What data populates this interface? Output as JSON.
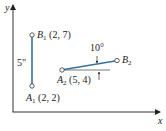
{
  "diagram": {
    "axes": {
      "x_label": "x",
      "y_label": "y"
    },
    "points": [
      {
        "name": "A",
        "sub": "1",
        "coords": "(2, 2)"
      },
      {
        "name": "B",
        "sub": "1",
        "coords": "(2, 7)"
      },
      {
        "name": "A",
        "sub": "2",
        "coords": "(5, 4)"
      },
      {
        "name": "B",
        "sub": "2",
        "coords": ""
      }
    ],
    "segment_length_label": "5\"",
    "rotation_angle_label": "10°",
    "colors": {
      "segment": "#3a6f9a",
      "axis": "#333333",
      "text": "#222222"
    }
  }
}
